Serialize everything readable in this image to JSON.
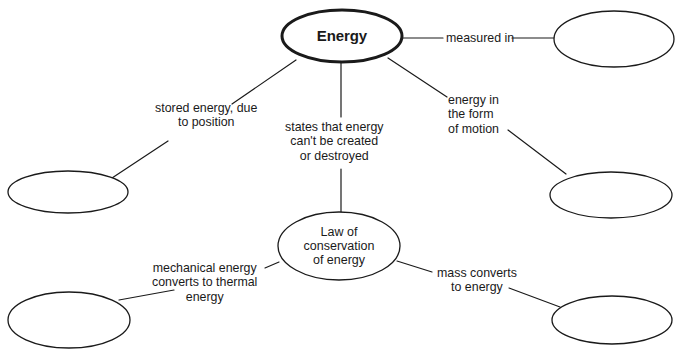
{
  "diagram": {
    "type": "concept-map",
    "canvas": {
      "width": 682,
      "height": 358
    },
    "style": {
      "background": "#ffffff",
      "node_stroke": "#1a1a1a",
      "node_fill": "#ffffff",
      "edge_stroke": "#1a1a1a",
      "text_color": "#1a1a1a",
      "root_stroke_width": "3",
      "node_stroke_width": "1.3",
      "edge_stroke_width": "1.2"
    },
    "nodes": [
      {
        "id": "energy",
        "label": "Energy",
        "filled_in": true,
        "emphasis": "bold",
        "cx": 342,
        "cy": 36,
        "rx": 60,
        "ry": 26,
        "stroke_width": 3
      },
      {
        "id": "measured-unit",
        "label": "",
        "filled_in": false,
        "emphasis": "none",
        "cx": 614,
        "cy": 39,
        "rx": 60,
        "ry": 28,
        "stroke_width": 1.3
      },
      {
        "id": "potential-energy",
        "label": "",
        "filled_in": false,
        "emphasis": "none",
        "cx": 68,
        "cy": 192,
        "rx": 60,
        "ry": 21,
        "stroke_width": 1.3
      },
      {
        "id": "kinetic-energy",
        "label": "",
        "filled_in": false,
        "emphasis": "none",
        "cx": 611,
        "cy": 195,
        "rx": 61,
        "ry": 23,
        "stroke_width": 1.3
      },
      {
        "id": "law-of-conservation",
        "label": "Law of\nconservation\nof energy",
        "filled_in": true,
        "emphasis": "none",
        "cx": 339,
        "cy": 246,
        "rx": 61,
        "ry": 34,
        "stroke_width": 1.3
      },
      {
        "id": "friction",
        "label": "",
        "filled_in": false,
        "emphasis": "none",
        "cx": 69,
        "cy": 320,
        "rx": 61,
        "ry": 28,
        "stroke_width": 1.3
      },
      {
        "id": "nuclear-energy",
        "label": "",
        "filled_in": false,
        "emphasis": "none",
        "cx": 612,
        "cy": 320,
        "rx": 60,
        "ry": 24,
        "stroke_width": 1.3
      }
    ],
    "edges": [
      {
        "id": "energy-to-measured-unit",
        "from": "energy",
        "to": "measured-unit",
        "label": "measured in",
        "label_x": 446,
        "label_y": 31,
        "segments": [
          {
            "x1": 402,
            "y1": 38,
            "x2": 443,
            "y2": 38
          },
          {
            "x1": 512,
            "y1": 38,
            "x2": 554,
            "y2": 38
          }
        ]
      },
      {
        "id": "energy-to-potential-energy",
        "from": "energy",
        "to": "potential-energy",
        "label": "stored energy, due\nto position",
        "label_x": 155,
        "label_y": 101,
        "segments": [
          {
            "x1": 296,
            "y1": 60,
            "x2": 232,
            "y2": 104
          },
          {
            "x1": 168,
            "y1": 141,
            "x2": 112,
            "y2": 178
          }
        ]
      },
      {
        "id": "energy-to-law-of-conservation",
        "from": "energy",
        "to": "law-of-conservation",
        "label": "states that energy\ncan't be created\nor destroyed",
        "label_x": 285,
        "label_y": 120,
        "segments": [
          {
            "x1": 341,
            "y1": 62,
            "x2": 341,
            "y2": 117
          },
          {
            "x1": 341,
            "y1": 169,
            "x2": 341,
            "y2": 212
          }
        ]
      },
      {
        "id": "energy-to-kinetic-energy",
        "from": "energy",
        "to": "kinetic-energy",
        "label": "energy in\nthe form\nof motion",
        "label_x": 448,
        "label_y": 93,
        "segments": [
          {
            "x1": 388,
            "y1": 58,
            "x2": 447,
            "y2": 97
          },
          {
            "x1": 508,
            "y1": 130,
            "x2": 566,
            "y2": 174
          }
        ]
      },
      {
        "id": "law-to-friction",
        "from": "law-of-conservation",
        "to": "friction",
        "label": "mechanical energy\nconverts to thermal\nenergy",
        "label_x": 152,
        "label_y": 261,
        "segments": [
          {
            "x1": 279,
            "y1": 262,
            "x2": 265,
            "y2": 268
          },
          {
            "x1": 174,
            "y1": 290,
            "x2": 119,
            "y2": 300
          }
        ]
      },
      {
        "id": "law-to-nuclear-energy",
        "from": "law-of-conservation",
        "to": "nuclear-energy",
        "label": "mass converts\nto energy",
        "label_x": 437,
        "label_y": 266,
        "segments": [
          {
            "x1": 397,
            "y1": 261,
            "x2": 432,
            "y2": 272
          },
          {
            "x1": 509,
            "y1": 288,
            "x2": 560,
            "y2": 307
          }
        ]
      }
    ]
  }
}
